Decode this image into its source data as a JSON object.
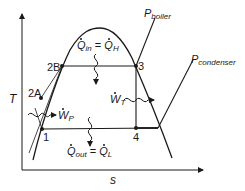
{
  "diagram": {
    "type": "T-s diagram (Rankine cycle)",
    "axes": {
      "y_label": "T",
      "x_label": "s"
    },
    "states": [
      {
        "id": "1",
        "label": "1"
      },
      {
        "id": "2A",
        "label": "2A"
      },
      {
        "id": "2B",
        "label": "2B"
      },
      {
        "id": "3",
        "label": "3"
      },
      {
        "id": "4",
        "label": "4"
      }
    ],
    "isobars": {
      "boiler": {
        "symbol": "P",
        "subscript": "boiler"
      },
      "condenser": {
        "symbol": "P",
        "subscript": "condenser"
      }
    },
    "energy_flows": {
      "heat_in": {
        "lhs_symbol": "Q",
        "lhs_sub": "in",
        "eq": "=",
        "rhs_symbol": "Q",
        "rhs_sub": "H"
      },
      "heat_out": {
        "lhs_symbol": "Q",
        "lhs_sub": "out",
        "eq": "=",
        "rhs_symbol": "Q",
        "rhs_sub": "L"
      },
      "turbine_work": {
        "symbol": "W",
        "sub": "T"
      },
      "pump_work": {
        "symbol": "W",
        "sub": "P"
      }
    },
    "colors": {
      "line": "#1a1a1a",
      "background": "#ffffff"
    }
  }
}
